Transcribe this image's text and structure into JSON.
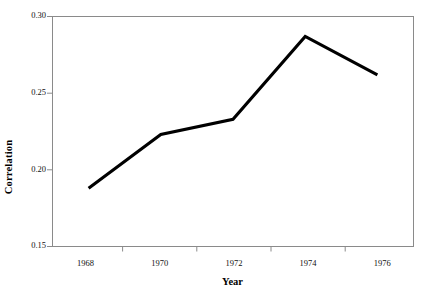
{
  "chart_data": {
    "type": "line",
    "title": "",
    "xlabel": "Year",
    "ylabel": "Correlation",
    "x": [
      1968,
      1970,
      1972,
      1974,
      1976
    ],
    "values": [
      0.188,
      0.223,
      0.233,
      0.287,
      0.262
    ],
    "series": [
      {
        "name": "Correlation",
        "values": [
          0.188,
          0.223,
          0.233,
          0.287,
          0.262
        ],
        "color": "#000000"
      }
    ],
    "xlim": [
      1967,
      1977
    ],
    "ylim": [
      0.15,
      0.3
    ],
    "x_tick_labels": [
      "1968",
      "1970",
      "1972",
      "1974",
      "1976"
    ],
    "y_tick_labels": [
      "0.15",
      "0.20",
      "0.25",
      "0.30"
    ],
    "y_ticks": [
      0.15,
      0.2,
      0.25,
      0.3
    ],
    "x_minor_ticks": [
      1969,
      1971,
      1973,
      1975
    ],
    "grid": false,
    "legend": false,
    "legend_position": "none",
    "frame": true,
    "line_color": "#000000",
    "axis_color": "#808080",
    "background_color": "#ffffff"
  },
  "axes": {
    "y_title": "Correlation",
    "x_title": "Year"
  }
}
